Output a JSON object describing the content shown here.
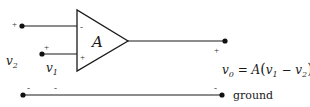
{
  "diagram": {
    "type": "operational amplifier schematic",
    "amplifier": {
      "gain_label": "A",
      "inverting_sign": "-",
      "noninverting_sign": "+"
    },
    "inputs": {
      "v2": {
        "label_main": "v",
        "label_sub": "2",
        "terminal_sign": "+"
      },
      "v1": {
        "label_main": "v",
        "label_sub": "1",
        "terminal_sign": "+"
      }
    },
    "output": {
      "terminal_sign": "+",
      "equation": {
        "lhs_main": "v",
        "lhs_sub": "0",
        "equals": " = ",
        "gain": "A",
        "open": "(",
        "t1_main": "v",
        "t1_sub": "1",
        "minus": " − ",
        "t2_main": "v",
        "t2_sub": "2",
        "close": ")"
      }
    },
    "ground": {
      "label": "ground",
      "left_sign": "-",
      "mid_sign": "-",
      "right_sign": "-"
    },
    "colors": {
      "line": "#1a1a1a",
      "background": "#ffffff"
    }
  }
}
